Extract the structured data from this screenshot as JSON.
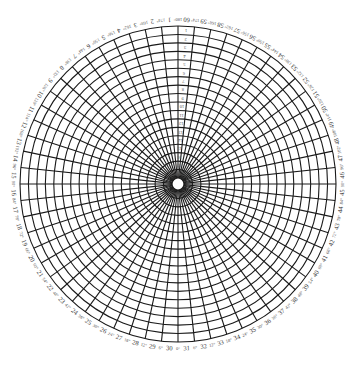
{
  "diagram": {
    "type": "polar-grid",
    "center": {
      "x": 178,
      "y": 184
    },
    "outer_radius": 158,
    "inner_radius": 6,
    "ring_count": 18,
    "spoke_count": 60,
    "spoke_angle_step_deg": 6,
    "line_color": "#1a1a1a",
    "background": "#ffffff",
    "spoke_numbers": [
      "1",
      "2",
      "3",
      "4",
      "5",
      "6",
      "7",
      "8",
      "9",
      "10",
      "11",
      "12",
      "13",
      "14",
      "15",
      "16",
      "17",
      "18",
      "19",
      "20",
      "21",
      "22",
      "23",
      "24",
      "25",
      "26",
      "27",
      "28",
      "29",
      "30",
      "31",
      "32",
      "33",
      "34",
      "35",
      "36",
      "37",
      "38",
      "39",
      "40",
      "41",
      "42",
      "43",
      "44",
      "45",
      "46",
      "47",
      "48",
      "49",
      "50",
      "51",
      "52",
      "53",
      "54",
      "55",
      "56",
      "57",
      "58",
      "59",
      "60"
    ],
    "degree_labels": [
      "0°",
      "6°",
      "12°",
      "18°",
      "24°",
      "30°",
      "36°",
      "42°",
      "48°",
      "54°",
      "60°",
      "66°",
      "72°",
      "78°",
      "84°",
      "90°",
      "96°",
      "102°",
      "108°",
      "114°",
      "120°",
      "126°",
      "132°",
      "138°",
      "144°",
      "150°",
      "156°",
      "162°",
      "168°",
      "174°",
      "180°"
    ],
    "ring_labels": [
      "1",
      "2",
      "3",
      "4",
      "5",
      "6",
      "7",
      "8",
      "9",
      "10",
      "11",
      "12",
      "13",
      "14",
      "15",
      "16",
      "17",
      "18"
    ]
  }
}
